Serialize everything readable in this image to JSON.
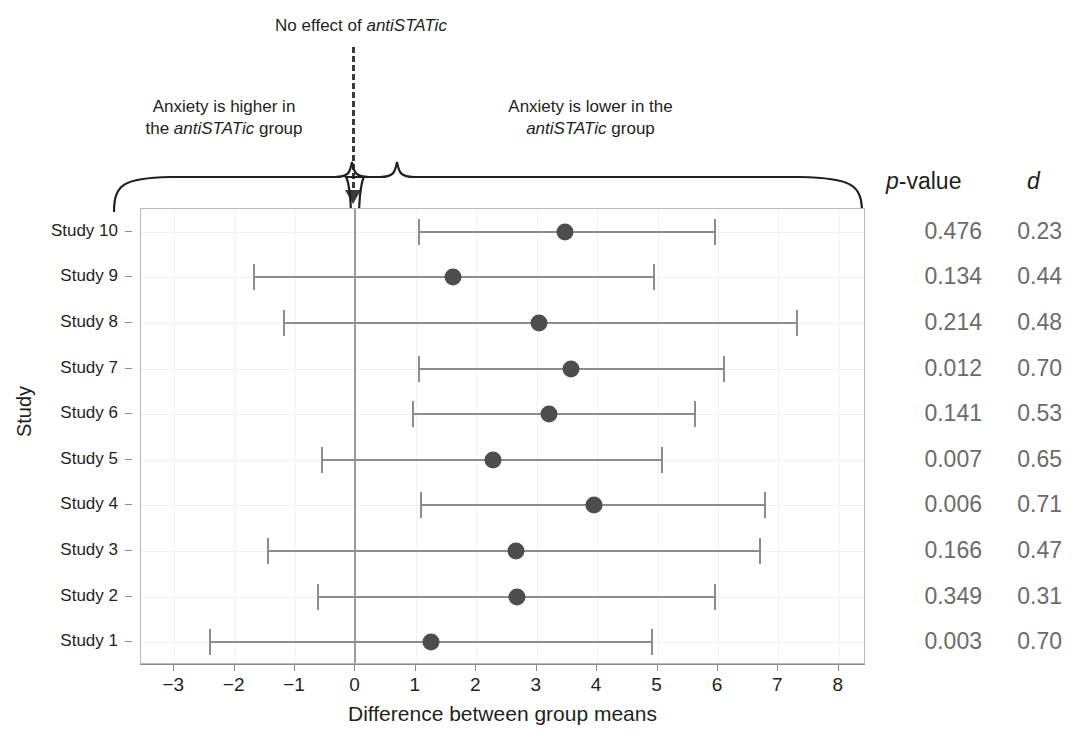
{
  "annotations": {
    "no_effect": {
      "prefix": "No effect of ",
      "emphasis": "antiSTATic",
      "suffix": ""
    },
    "left_bracket": {
      "line1": "Anxiety is higher in",
      "line2_prefix": "the ",
      "line2_emphasis": "antiSTATic",
      "line2_suffix": " group"
    },
    "right_bracket": {
      "line1": "Anxiety is lower in the",
      "line2_emphasis": "antiSTATic",
      "line2_suffix": " group"
    }
  },
  "headers": {
    "p_value": {
      "emphasis": "p",
      "rest": "-value"
    },
    "d": "d"
  },
  "axes": {
    "x_title": "Difference between group means",
    "y_title": "Study",
    "x_ticks": [
      -3,
      -2,
      -1,
      0,
      1,
      2,
      3,
      4,
      5,
      6,
      7,
      8
    ],
    "x_tick_labels": [
      "−3",
      "−2",
      "−1",
      "0",
      "1",
      "2",
      "3",
      "4",
      "5",
      "6",
      "7",
      "8"
    ],
    "xlim": [
      -3.55,
      8.45
    ],
    "grid": true
  },
  "chart_data": {
    "type": "scatter",
    "title": "",
    "xlabel": "Difference between group means",
    "ylabel": "Study",
    "xlim": [
      -3.55,
      8.45
    ],
    "grid": true,
    "legend": "none",
    "reference_line": 0,
    "categories": [
      "Study 10",
      "Study 9",
      "Study 8",
      "Study 7",
      "Study 6",
      "Study 5",
      "Study 4",
      "Study 3",
      "Study 2",
      "Study 1"
    ],
    "columns": [
      "Study",
      "estimate",
      "ci_low",
      "ci_high",
      "p-value",
      "d"
    ],
    "rows": [
      {
        "study": "Study 10",
        "estimate": 3.46,
        "ci_low": 1.05,
        "ci_high": 5.95,
        "p_value": "0.476",
        "d": "0.23"
      },
      {
        "study": "Study 9",
        "estimate": 1.61,
        "ci_low": -1.68,
        "ci_high": 4.94,
        "p_value": "0.134",
        "d": "0.44"
      },
      {
        "study": "Study 8",
        "estimate": 3.03,
        "ci_low": -1.18,
        "ci_high": 7.3,
        "p_value": "0.214",
        "d": "0.48"
      },
      {
        "study": "Study 7",
        "estimate": 3.56,
        "ci_low": 1.05,
        "ci_high": 6.1,
        "p_value": "0.012",
        "d": "0.70"
      },
      {
        "study": "Study 6",
        "estimate": 3.2,
        "ci_low": 0.95,
        "ci_high": 5.62,
        "p_value": "0.141",
        "d": "0.53"
      },
      {
        "study": "Study 5",
        "estimate": 2.27,
        "ci_low": -0.56,
        "ci_high": 5.07,
        "p_value": "0.007",
        "d": "0.65"
      },
      {
        "study": "Study 4",
        "estimate": 3.95,
        "ci_low": 1.08,
        "ci_high": 6.78,
        "p_value": "0.006",
        "d": "0.71"
      },
      {
        "study": "Study 3",
        "estimate": 2.65,
        "ci_low": -1.45,
        "ci_high": 6.7,
        "p_value": "0.166",
        "d": "0.47"
      },
      {
        "study": "Study 2",
        "estimate": 2.67,
        "ci_low": -0.62,
        "ci_high": 5.95,
        "p_value": "0.349",
        "d": "0.31"
      },
      {
        "study": "Study 1",
        "estimate": 1.25,
        "ci_low": -2.4,
        "ci_high": 4.9,
        "p_value": "0.003",
        "d": "0.70"
      }
    ]
  },
  "colors": {
    "point": "#4d4d4d",
    "interval": "#8c8c8c",
    "zero_line": "#9a9a9a",
    "stat_text": "#6b6b6b",
    "text": "#231f20",
    "grid": "#f2f2f2",
    "frame": "#b9b9b9"
  }
}
